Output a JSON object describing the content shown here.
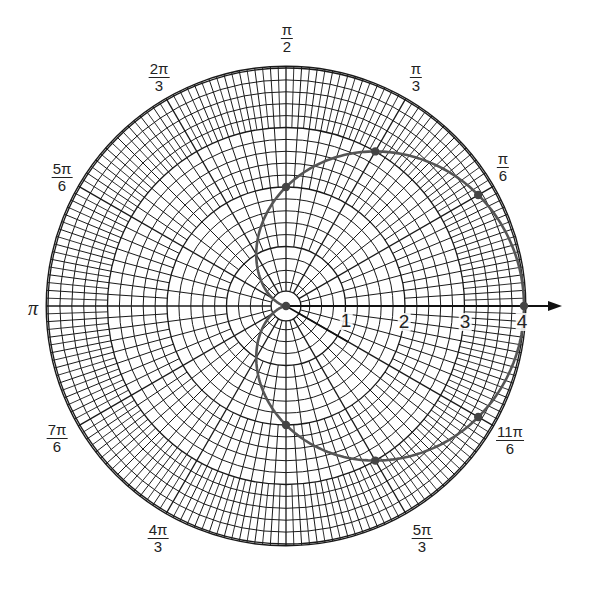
{
  "chart_data": {
    "type": "scatter",
    "subtype": "polar",
    "title": "",
    "curve": "r = 2 + 2cos(theta) (cardioid)",
    "grid": true,
    "r_range": [
      0,
      4
    ],
    "r_tick_labels": [
      "1",
      "2",
      "3",
      "4"
    ],
    "angle_labels": [
      {
        "angle": "pi/2",
        "num": "π",
        "den": "2"
      },
      {
        "angle": "pi/3",
        "num": "π",
        "den": "3"
      },
      {
        "angle": "2pi/3",
        "num": "2π",
        "den": "3"
      },
      {
        "angle": "pi/6",
        "num": "π",
        "den": "6"
      },
      {
        "angle": "5pi/6",
        "num": "5π",
        "den": "6"
      },
      {
        "angle": "pi",
        "num": "π",
        "den": ""
      },
      {
        "angle": "7pi/6",
        "num": "7π",
        "den": "6"
      },
      {
        "angle": "4pi/3",
        "num": "4π",
        "den": "3"
      },
      {
        "angle": "5pi/3",
        "num": "5π",
        "den": "3"
      },
      {
        "angle": "11pi/6",
        "num": "11π",
        "den": "6"
      }
    ],
    "points": [
      {
        "theta_deg": 0,
        "r": 4
      },
      {
        "theta_deg": 30,
        "r": 3.73
      },
      {
        "theta_deg": 60,
        "r": 3
      },
      {
        "theta_deg": 90,
        "r": 2
      },
      {
        "theta_deg": 180,
        "r": 0
      },
      {
        "theta_deg": 270,
        "r": 2
      },
      {
        "theta_deg": 300,
        "r": 3
      },
      {
        "theta_deg": 330,
        "r": 3.73
      }
    ],
    "colors": {
      "grid": "#1a1a1a",
      "curve": "#555555",
      "points": "#444444"
    }
  },
  "labels": {
    "pi_2": {
      "num": "π",
      "den": "2"
    },
    "pi_3": {
      "num": "π",
      "den": "3"
    },
    "two_pi_3": {
      "num": "2π",
      "den": "3"
    },
    "pi_6": {
      "num": "π",
      "den": "6"
    },
    "five_pi_6": {
      "num": "5π",
      "den": "6"
    },
    "pi": "π",
    "seven_pi_6": {
      "num": "7π",
      "den": "6"
    },
    "four_pi_3": {
      "num": "4π",
      "den": "3"
    },
    "five_pi_3": {
      "num": "5π",
      "den": "3"
    },
    "eleven_pi_6": {
      "num": "11π",
      "den": "6"
    },
    "r1": "1",
    "r2": "2",
    "r3": "3",
    "r4": "4"
  }
}
